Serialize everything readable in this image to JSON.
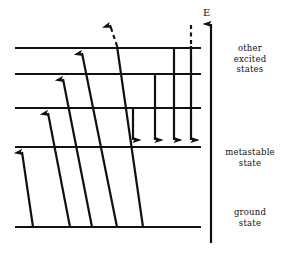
{
  "figure": {
    "type": "energy-level-diagram",
    "title": "",
    "background_color": "#ffffff",
    "line_color": "#111111",
    "width": 286,
    "height": 253
  },
  "axis": {
    "label": "E",
    "name": "energy-axis",
    "direction": "up",
    "x": 211,
    "y_top": 24,
    "y_bottom": 243
  },
  "labels": {
    "other_excited_states": "other\nexcited\nstates",
    "metastable_state": "metastable\nstate",
    "ground_state": "ground\nstate"
  },
  "levels": [
    {
      "name": "excited-level-4",
      "y": 48,
      "x_start": 15,
      "x_end": 201,
      "group": "other excited states"
    },
    {
      "name": "excited-level-3",
      "y": 74,
      "x_start": 15,
      "x_end": 201,
      "group": "other excited states"
    },
    {
      "name": "excited-level-2",
      "y": 108,
      "x_start": 15,
      "x_end": 201,
      "group": "other excited states"
    },
    {
      "name": "metastable-level",
      "y": 147,
      "x_start": 15,
      "x_end": 201,
      "group": "metastable state"
    },
    {
      "name": "ground-level",
      "y": 227,
      "x_start": 15,
      "x_end": 201,
      "group": "ground state"
    }
  ],
  "excitation_arrows": [
    {
      "name": "excitation-1",
      "x1": 33,
      "y1": 227,
      "x2": 22,
      "y2": 150,
      "dashed": false
    },
    {
      "name": "excitation-2",
      "x1": 70,
      "y1": 227,
      "x2": 48,
      "y2": 111,
      "dashed": false
    },
    {
      "name": "excitation-3",
      "x1": 92,
      "y1": 227,
      "x2": 63,
      "y2": 77,
      "dashed": false
    },
    {
      "name": "excitation-4",
      "x1": 117,
      "y1": 227,
      "x2": 82,
      "y2": 51,
      "dashed": false
    },
    {
      "name": "excitation-ionizing",
      "x1": 143,
      "y1": 227,
      "x2": 116,
      "y2": 48,
      "dashed": true,
      "dash_from_y": 48,
      "dash_to_y": 18,
      "note": "continues above highest level"
    }
  ],
  "emission_arrows": [
    {
      "name": "emission-1",
      "x": 133,
      "y1": 108,
      "y2": 144,
      "dashed": false
    },
    {
      "name": "emission-2",
      "x": 155,
      "y1": 74,
      "y2": 144,
      "dashed": false
    },
    {
      "name": "emission-3",
      "x": 174,
      "y1": 48,
      "y2": 144,
      "dashed": false
    },
    {
      "name": "emission-4",
      "x": 191,
      "y1": 48,
      "y2": 144,
      "dashed": true,
      "dash_from_y": 18,
      "dash_to_y": 46,
      "note": "originates above highest level"
    }
  ]
}
